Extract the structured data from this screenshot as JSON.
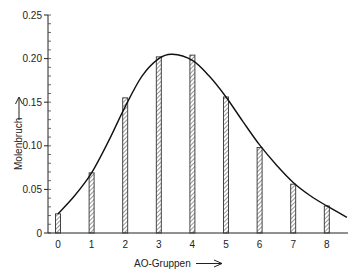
{
  "chart_data": {
    "type": "bar",
    "title": "",
    "xlabel": "AO-Gruppen",
    "ylabel": "Molenbruch",
    "categories": [
      "0",
      "1",
      "2",
      "3",
      "4",
      "5",
      "6",
      "7",
      "8"
    ],
    "series": [
      {
        "name": "Molenbruch (bars)",
        "style": "hatched-bar",
        "values": [
          0.022,
          0.069,
          0.155,
          0.202,
          0.204,
          0.156,
          0.098,
          0.056,
          0.031
        ]
      },
      {
        "name": "fitted curve",
        "style": "smooth-line",
        "x": [
          0,
          0.5,
          1,
          1.5,
          2,
          2.5,
          3,
          3.4,
          4,
          4.5,
          5,
          5.5,
          6,
          6.5,
          7,
          7.5,
          8,
          8.6
        ],
        "values": [
          0.022,
          0.043,
          0.069,
          0.105,
          0.145,
          0.18,
          0.2,
          0.205,
          0.198,
          0.18,
          0.156,
          0.128,
          0.101,
          0.078,
          0.058,
          0.043,
          0.031,
          0.018
        ]
      }
    ],
    "yticks": [
      "0",
      "0.05",
      "0.10",
      "0.15",
      "0.20",
      "0.25"
    ],
    "ylim": [
      0,
      0.25
    ],
    "xlim": [
      0,
      8.6
    ],
    "grid": false,
    "legend": "none",
    "y_minor_tick_step": 0.01
  },
  "labels": {
    "xlabel": "AO-Gruppen",
    "ylabel": "Molenbruch",
    "yticks": [
      "0",
      "0.05",
      "0.10",
      "0.15",
      "0.20",
      "0.25"
    ],
    "xticks": [
      "0",
      "1",
      "2",
      "3",
      "4",
      "5",
      "6",
      "7",
      "8"
    ]
  }
}
